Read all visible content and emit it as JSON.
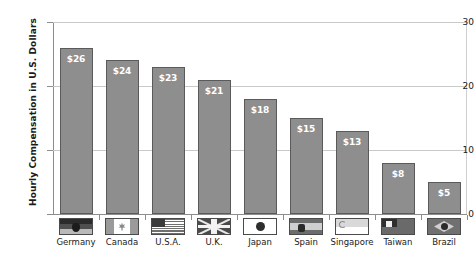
{
  "chart_data": {
    "type": "bar",
    "title": "",
    "xlabel": "",
    "ylabel": "Hourly Compensation in U.S. Dollars",
    "ylim": [
      0,
      30
    ],
    "yticks": [
      0,
      10,
      20,
      30
    ],
    "ytick_labels": [
      "0",
      "10",
      "20",
      "30"
    ],
    "grid": true,
    "grid_axis": "y",
    "legend": false,
    "categories": [
      "Germany",
      "Canada",
      "U.S.A.",
      "U.K.",
      "Japan",
      "Spain",
      "Singapore",
      "Taiwan",
      "Brazil"
    ],
    "values": [
      26,
      24,
      23,
      21,
      18,
      15,
      13,
      8,
      5
    ],
    "data_labels": [
      "$26",
      "$24",
      "$23",
      "$21",
      "$18",
      "$15",
      "$13",
      "$8",
      "$5"
    ],
    "bar_color": "#8e8e8e",
    "bar_border_color": "#5a5a5a",
    "data_label_color": "#ffffff",
    "axis_color": "#8d8d8d",
    "grid_color": "#c9c9c9",
    "flags": [
      "flag-germany",
      "flag-canada",
      "flag-usa",
      "flag-uk",
      "flag-japan",
      "flag-spain",
      "flag-singapore",
      "flag-taiwan",
      "flag-brazil"
    ]
  }
}
